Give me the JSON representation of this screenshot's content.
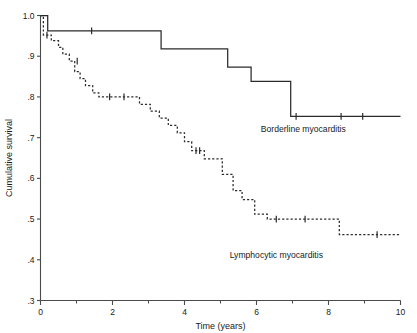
{
  "chart_data": {
    "type": "line",
    "title": "",
    "xlabel": "Time (years)",
    "ylabel": "Cumulative survival",
    "xlim": [
      0,
      10
    ],
    "ylim": [
      0.3,
      1.0
    ],
    "grid": false,
    "legend_position": "inline-annotation",
    "x_ticks": [
      {
        "value": 0,
        "label": "0"
      },
      {
        "value": 1,
        "label": ""
      },
      {
        "value": 2,
        "label": "2"
      },
      {
        "value": 3,
        "label": ""
      },
      {
        "value": 4,
        "label": "4"
      },
      {
        "value": 5,
        "label": ""
      },
      {
        "value": 6,
        "label": "6"
      },
      {
        "value": 7,
        "label": ""
      },
      {
        "value": 8,
        "label": "8"
      },
      {
        "value": 9,
        "label": ""
      },
      {
        "value": 10,
        "label": "10"
      }
    ],
    "y_ticks": [
      {
        "value": 1.0,
        "label": "1.0"
      },
      {
        "value": 0.9,
        "label": ".9"
      },
      {
        "value": 0.8,
        "label": ".8"
      },
      {
        "value": 0.7,
        "label": ".7"
      },
      {
        "value": 0.6,
        "label": ".6"
      },
      {
        "value": 0.5,
        "label": ".5"
      },
      {
        "value": 0.4,
        "label": ".4"
      },
      {
        "value": 0.3,
        "label": ".3"
      }
    ],
    "series": [
      {
        "name": "Borderline myocarditis",
        "style": "solid",
        "annotation_label": "Borderline myocarditis",
        "steps": [
          [
            0.0,
            1.0
          ],
          [
            0.2,
            1.0
          ],
          [
            0.2,
            0.962
          ],
          [
            3.35,
            0.962
          ],
          [
            3.35,
            0.918
          ],
          [
            5.2,
            0.918
          ],
          [
            5.2,
            0.873
          ],
          [
            5.85,
            0.873
          ],
          [
            5.85,
            0.838
          ],
          [
            6.35,
            0.838
          ],
          [
            6.35,
            0.838
          ],
          [
            6.95,
            0.838
          ],
          [
            6.95,
            0.752
          ],
          [
            10.0,
            0.752
          ]
        ],
        "censor_marks": [
          [
            1.42,
            0.962
          ],
          [
            7.1,
            0.752
          ],
          [
            8.35,
            0.752
          ],
          [
            8.95,
            0.752
          ]
        ]
      },
      {
        "name": "Lymphocytic myocarditis",
        "style": "dashed",
        "annotation_label": "Lymphocytic myocarditis",
        "steps": [
          [
            0.0,
            1.0
          ],
          [
            0.08,
            1.0
          ],
          [
            0.08,
            0.952
          ],
          [
            0.3,
            0.952
          ],
          [
            0.3,
            0.938
          ],
          [
            0.5,
            0.938
          ],
          [
            0.5,
            0.922
          ],
          [
            0.62,
            0.922
          ],
          [
            0.62,
            0.905
          ],
          [
            0.8,
            0.905
          ],
          [
            0.8,
            0.888
          ],
          [
            0.95,
            0.888
          ],
          [
            0.95,
            0.862
          ],
          [
            1.1,
            0.862
          ],
          [
            1.1,
            0.845
          ],
          [
            1.25,
            0.845
          ],
          [
            1.25,
            0.828
          ],
          [
            1.45,
            0.828
          ],
          [
            1.45,
            0.81
          ],
          [
            1.62,
            0.81
          ],
          [
            1.62,
            0.8
          ],
          [
            2.75,
            0.8
          ],
          [
            2.75,
            0.782
          ],
          [
            3.05,
            0.782
          ],
          [
            3.05,
            0.765
          ],
          [
            3.3,
            0.765
          ],
          [
            3.3,
            0.748
          ],
          [
            3.55,
            0.748
          ],
          [
            3.55,
            0.73
          ],
          [
            3.8,
            0.73
          ],
          [
            3.8,
            0.712
          ],
          [
            4.0,
            0.712
          ],
          [
            4.0,
            0.69
          ],
          [
            4.2,
            0.69
          ],
          [
            4.2,
            0.668
          ],
          [
            4.55,
            0.668
          ],
          [
            4.55,
            0.648
          ],
          [
            5.05,
            0.648
          ],
          [
            5.05,
            0.61
          ],
          [
            5.35,
            0.61
          ],
          [
            5.35,
            0.57
          ],
          [
            5.6,
            0.57
          ],
          [
            5.6,
            0.548
          ],
          [
            5.95,
            0.548
          ],
          [
            5.95,
            0.512
          ],
          [
            6.3,
            0.512
          ],
          [
            6.3,
            0.5
          ],
          [
            8.3,
            0.5
          ],
          [
            8.3,
            0.462
          ],
          [
            10.0,
            0.462
          ]
        ],
        "censor_marks": [
          [
            0.18,
            0.952
          ],
          [
            1.02,
            0.888
          ],
          [
            1.92,
            0.8
          ],
          [
            2.32,
            0.8
          ],
          [
            4.32,
            0.668
          ],
          [
            4.42,
            0.668
          ],
          [
            6.55,
            0.5
          ],
          [
            7.35,
            0.5
          ],
          [
            9.35,
            0.462
          ]
        ]
      }
    ]
  },
  "annotations": {
    "borderline": {
      "text": "Borderline myocarditis",
      "x": 7.3,
      "y": 0.715
    },
    "lymphocytic": {
      "text": "Lymphocytic myocarditis",
      "x": 6.55,
      "y": 0.405
    }
  }
}
